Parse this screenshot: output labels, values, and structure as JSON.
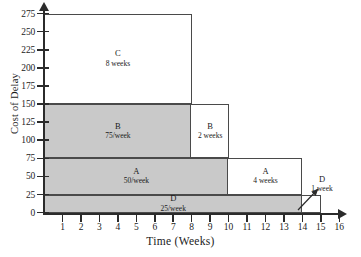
{
  "chart_data": {
    "type": "area",
    "title": "",
    "xlabel": "Time (Weeks)",
    "ylabel": "Cost of Delay",
    "xlim": [
      0,
      16
    ],
    "ylim": [
      0,
      275
    ],
    "xticks": [
      1,
      2,
      3,
      4,
      5,
      6,
      7,
      8,
      9,
      10,
      11,
      12,
      13,
      14,
      15,
      16
    ],
    "yticks": [
      0,
      25,
      50,
      75,
      100,
      125,
      150,
      175,
      200,
      225,
      250,
      275
    ],
    "grid": false,
    "legend": "none",
    "shaded_color": "#c9c9c9",
    "line_color": "#4a4a4a",
    "regions": [
      {
        "id": "region-d-shaded",
        "name": "D",
        "sub": "25/week",
        "x0": 0,
        "x1": 14,
        "y0": 0,
        "y1": 25,
        "style": "shaded"
      },
      {
        "id": "region-a-shaded",
        "name": "A",
        "sub": "50/week",
        "x0": 0,
        "x1": 10,
        "y0": 25,
        "y1": 75,
        "style": "shaded"
      },
      {
        "id": "region-b-shaded",
        "name": "B",
        "sub": "75/week",
        "x0": 0,
        "x1": 8,
        "y0": 75,
        "y1": 150,
        "style": "shaded"
      },
      {
        "id": "region-c-open",
        "name": "C",
        "sub": "8 weeks",
        "x0": 0,
        "x1": 8,
        "y0": 150,
        "y1": 275,
        "style": "open"
      },
      {
        "id": "region-b-open",
        "name": "B",
        "sub": "2 weeks",
        "x0": 8,
        "x1": 10,
        "y0": 75,
        "y1": 150,
        "style": "open"
      },
      {
        "id": "region-a-open",
        "name": "A",
        "sub": "4 weeks",
        "x0": 10,
        "x1": 14,
        "y0": 25,
        "y1": 75,
        "style": "open"
      },
      {
        "id": "region-d-open",
        "name": "",
        "sub": "",
        "x0": 14,
        "x1": 15,
        "y0": 0,
        "y1": 25,
        "style": "open"
      }
    ],
    "annotations": [
      {
        "id": "d-callout",
        "name": "D",
        "sub": "1 week",
        "points_to": {
          "x": 14.5,
          "y": 12
        }
      }
    ]
  }
}
